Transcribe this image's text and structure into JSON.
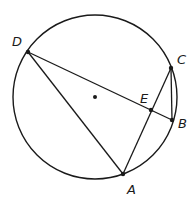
{
  "diagram": {
    "type": "circle-geometry",
    "circle": {
      "cx": 95,
      "cy": 97,
      "r": 82,
      "stroke": "#1a1a1a"
    },
    "center_dot": {
      "x": 95,
      "y": 97
    },
    "points": {
      "D": {
        "label": "D",
        "x": 28,
        "y": 52,
        "lx": 12,
        "ly": 46
      },
      "C": {
        "label": "C",
        "x": 171,
        "y": 68,
        "lx": 177,
        "ly": 64
      },
      "B": {
        "label": "B",
        "x": 172,
        "y": 120,
        "lx": 178,
        "ly": 128
      },
      "E": {
        "label": "E",
        "x": 151,
        "y": 110,
        "lx": 140,
        "ly": 103
      },
      "A": {
        "label": "A",
        "x": 123,
        "y": 174,
        "lx": 127,
        "ly": 194
      }
    },
    "segments": [
      [
        "D",
        "B"
      ],
      [
        "D",
        "A"
      ],
      [
        "A",
        "C"
      ],
      [
        "C",
        "B"
      ]
    ],
    "labels": [
      "D",
      "C",
      "E",
      "B",
      "A"
    ]
  }
}
